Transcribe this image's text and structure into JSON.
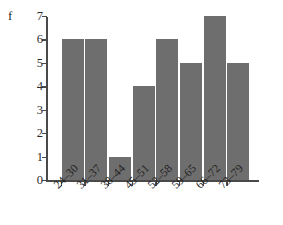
{
  "chart_data": {
    "type": "bar",
    "title": "",
    "xlabel": "",
    "ylabel": "f",
    "categories": [
      "24–30",
      "31–37",
      "38–44",
      "45–51",
      "52–58",
      "59–65",
      "66–72",
      "73–79"
    ],
    "values": [
      6,
      6,
      1,
      4,
      6,
      5,
      7,
      5
    ],
    "ylim": [
      0,
      7
    ],
    "yticks": [
      "0",
      "1",
      "2",
      "3",
      "4",
      "5",
      "6",
      "7"
    ],
    "grid": false,
    "legend": false,
    "bar_color": "#6e6e6e",
    "axis_color": "#4a4a4a",
    "background_color": "#ffffff"
  }
}
